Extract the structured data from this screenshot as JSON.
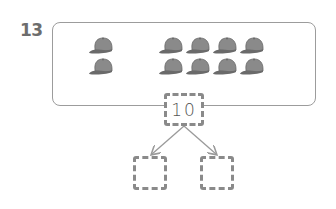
{
  "question": {
    "number": "13",
    "picture": {
      "object": "baseball-cap",
      "groups": [
        {
          "rows": 2,
          "cols": 1,
          "count": 2
        },
        {
          "rows": 2,
          "cols": 4,
          "count": 8
        }
      ],
      "total": 10
    },
    "number_bond": {
      "whole": "10",
      "parts": [
        "",
        ""
      ]
    }
  },
  "colors": {
    "cap_fill": "#8a8a8a",
    "cap_shade": "#6a6a6a",
    "border": "#9c9c9c",
    "dashed_border": "#8a8a8a",
    "number_color": "#6d6d6d"
  }
}
